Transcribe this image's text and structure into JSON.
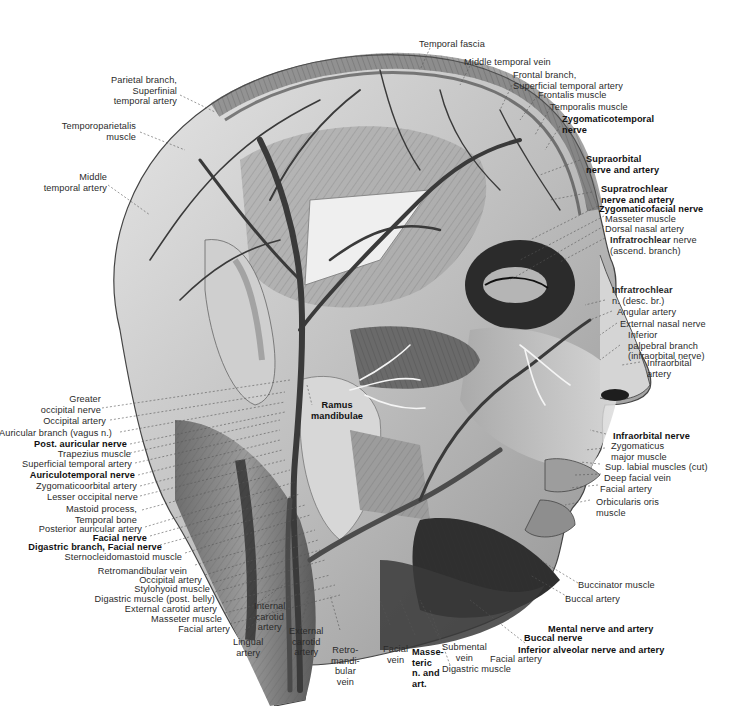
{
  "figure": {
    "center_label": "Ramus\nmandibulae"
  },
  "labels": {
    "top": [
      {
        "text": "Temporal fascia",
        "bold": false
      },
      {
        "text": "Middle temporal vein",
        "bold": false
      },
      {
        "text": "Frontal branch,\nSuperficial temporal artery",
        "bold": false
      },
      {
        "text": "Frontalis muscle",
        "bold": false
      },
      {
        "text": "Temporalis muscle",
        "bold": false
      },
      {
        "text": "Zygomaticotemporal\nnerve",
        "bold": true
      }
    ],
    "right": [
      {
        "text": "Supraorbital\nnerve and artery",
        "bold": true
      },
      {
        "text": "Supratrochlear\nnerve and artery",
        "bold": true
      },
      {
        "text": "Zygomaticofacial nerve",
        "bold": true
      },
      {
        "text": "Masseter muscle",
        "bold": false
      },
      {
        "text": "Dorsal nasal artery",
        "bold": false
      },
      {
        "text_bold": "Infratrochlear",
        "text_rest": " nerve\n(ascend. branch)"
      },
      {
        "text_bold": "Infratrochlear",
        "text_rest": "\nn. (desc. br.)"
      },
      {
        "text": "Angular artery",
        "bold": false
      },
      {
        "text": "External nasal nerve",
        "bold": false
      },
      {
        "text": "Inferior\npalpebral branch\n(infraorbital nerve)",
        "bold": false
      },
      {
        "text": "Infraorbital\nartery",
        "bold": false
      },
      {
        "text": "Infraorbital nerve",
        "bold": true
      },
      {
        "text": "Zygomaticus\nmajor muscle",
        "bold": false
      },
      {
        "text": "Sup. labial muscles (cut)",
        "bold": false
      },
      {
        "text": "Deep facial vein",
        "bold": false
      },
      {
        "text": "Facial artery",
        "bold": false
      },
      {
        "text": "Orbicularis oris\nmuscle",
        "bold": false
      },
      {
        "text": "Buccinator muscle",
        "bold": false
      },
      {
        "text": "Buccal artery",
        "bold": false
      },
      {
        "text": "Mental nerve and artery",
        "bold": true
      },
      {
        "text": "Buccal nerve",
        "bold": true
      },
      {
        "text": "Inferior alveolar nerve and artery",
        "bold": true
      }
    ],
    "left": [
      {
        "text": "Parietal branch,\nSuperfinial\ntemporal artery",
        "bold": false
      },
      {
        "text": "Temporoparietalis\nmuscle",
        "bold": false
      },
      {
        "text": "Middle\ntemporal artery",
        "bold": false
      },
      {
        "text": "Greater\noccipital nerve",
        "bold": false
      },
      {
        "text": "Occipital artery",
        "bold": false
      },
      {
        "text": "Auricular branch (vagus n.)",
        "bold": false
      },
      {
        "text": "Post. auricular nerve",
        "bold": true
      },
      {
        "text": "Trapezius muscle",
        "bold": false
      },
      {
        "text": "Superficial temporal artery",
        "bold": false
      },
      {
        "text": "Auriculotemporal nerve",
        "bold": true
      },
      {
        "text": "Zygomaticoorbital artery",
        "bold": false
      },
      {
        "text": "Lesser occipital nerve",
        "bold": false
      },
      {
        "text": "Mastoid process,\nTemporal bone",
        "bold": false
      },
      {
        "text": "Posterior auricular artery",
        "bold": false
      },
      {
        "text": "Facial nerve",
        "bold": true
      },
      {
        "text": "Digastric branch, Facial nerve",
        "bold": true
      },
      {
        "text": "Sternocleidomastoid muscle",
        "bold": false
      },
      {
        "text": "Retromandibular vein",
        "bold": false
      },
      {
        "text": "Occipital artery",
        "bold": false
      },
      {
        "text": "Stylohyoid muscle",
        "bold": false
      },
      {
        "text": "Digastric muscle (post. belly)",
        "bold": false
      },
      {
        "text": "External carotid artery",
        "bold": false
      },
      {
        "text": "Masseter muscle",
        "bold": false
      },
      {
        "text": "Facial artery",
        "bold": false
      }
    ],
    "bottom": [
      {
        "text": "Internal\ncarotid\nartery",
        "bold": false
      },
      {
        "text": "Lingual\nartery",
        "bold": false
      },
      {
        "text": "External\ncarotid\nartery",
        "bold": false
      },
      {
        "text": "Retro-\nmandi-\nbular\nvein",
        "bold": false
      },
      {
        "text": "Facial\nvein",
        "bold": false
      },
      {
        "text": "Masse-\nteric\nn. and\nart.",
        "bold": true
      },
      {
        "text": "Submental\nvein",
        "bold": false
      },
      {
        "text": "Digastric muscle",
        "bold": false
      },
      {
        "text": "Facial artery",
        "bold": false
      }
    ]
  },
  "colors": {
    "background": "#ffffff",
    "ink": "#222222",
    "skin_light": "#d9d9d9",
    "muscle_mid": "#8a8a8a",
    "vessel_dark": "#3a3a3a",
    "shadow": "#1c1c1c"
  }
}
